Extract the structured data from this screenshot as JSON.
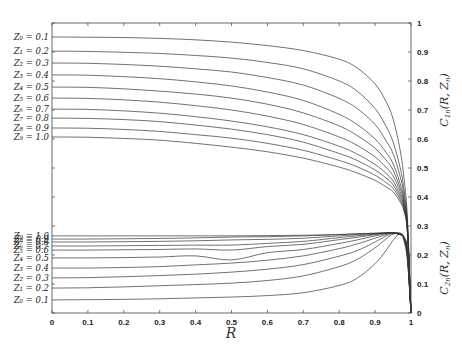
{
  "chart_data": {
    "type": "line",
    "title": "",
    "xlabel": "R",
    "ylabel_upper": "C_{1n}(R, Z_n)",
    "ylabel_lower": "C_{2n}(R, Z_n)",
    "xlim": [
      0,
      1
    ],
    "ylim": [
      0,
      1
    ],
    "grid": false,
    "x_ticks": [
      "0",
      "0.1",
      "0.2",
      "0.3",
      "0.4",
      "0.5",
      "0.6",
      "0.7",
      "0.8",
      "0.9",
      "1"
    ],
    "y_ticks": [
      "0",
      "0.1",
      "0.2",
      "0.3",
      "0.4",
      "0.5",
      "0.6",
      "0.7",
      "0.8",
      "0.9",
      "1"
    ],
    "y_axis_position": "right",
    "x": [
      0,
      0.1,
      0.2,
      0.3,
      0.4,
      0.5,
      0.6,
      0.7,
      0.8,
      0.85,
      0.9,
      0.93,
      0.95,
      0.97,
      0.98,
      0.99,
      1.0
    ],
    "series_upper": [
      {
        "name": "Z0 = 0.1",
        "label": "Z₀ = 0.1",
        "values": [
          0.952,
          0.951,
          0.95,
          0.947,
          0.942,
          0.934,
          0.922,
          0.905,
          0.875,
          0.845,
          0.79,
          0.73,
          0.67,
          0.56,
          0.47,
          0.33,
          0.0
        ]
      },
      {
        "name": "Z1 = 0.2",
        "label": "Z₁ = 0.2",
        "values": [
          0.903,
          0.902,
          0.899,
          0.895,
          0.888,
          0.879,
          0.864,
          0.842,
          0.8,
          0.765,
          0.705,
          0.645,
          0.59,
          0.5,
          0.43,
          0.31,
          0.0
        ]
      },
      {
        "name": "Z2 = 0.3",
        "label": "Z₂ = 0.3",
        "values": [
          0.862,
          0.861,
          0.857,
          0.851,
          0.842,
          0.831,
          0.812,
          0.786,
          0.74,
          0.705,
          0.65,
          0.595,
          0.55,
          0.47,
          0.41,
          0.3,
          0.0
        ]
      },
      {
        "name": "Z3 = 0.4",
        "label": "Z₃ = 0.4",
        "values": [
          0.821,
          0.82,
          0.815,
          0.808,
          0.797,
          0.783,
          0.762,
          0.733,
          0.685,
          0.65,
          0.6,
          0.555,
          0.515,
          0.445,
          0.395,
          0.295,
          0.0
        ]
      },
      {
        "name": "Z4 = 0.5",
        "label": "Z₄ = 0.5",
        "values": [
          0.779,
          0.778,
          0.773,
          0.765,
          0.755,
          0.741,
          0.72,
          0.69,
          0.645,
          0.612,
          0.568,
          0.528,
          0.493,
          0.43,
          0.385,
          0.29,
          0.0
        ]
      },
      {
        "name": "Z5 = 0.6",
        "label": "Z₅ = 0.6",
        "values": [
          0.741,
          0.74,
          0.735,
          0.727,
          0.715,
          0.7,
          0.679,
          0.65,
          0.607,
          0.578,
          0.538,
          0.503,
          0.473,
          0.418,
          0.377,
          0.287,
          0.0
        ]
      },
      {
        "name": "Z6 = 0.7",
        "label": "Z₆ = 0.7",
        "values": [
          0.703,
          0.702,
          0.697,
          0.689,
          0.677,
          0.662,
          0.642,
          0.615,
          0.575,
          0.548,
          0.512,
          0.482,
          0.455,
          0.407,
          0.37,
          0.284,
          0.0
        ]
      },
      {
        "name": "Z7 = 0.8",
        "label": "Z₇ = 0.8",
        "values": [
          0.672,
          0.671,
          0.667,
          0.66,
          0.648,
          0.634,
          0.615,
          0.589,
          0.55,
          0.526,
          0.493,
          0.466,
          0.442,
          0.398,
          0.364,
          0.282,
          0.0
        ]
      },
      {
        "name": "Z8 = 0.9",
        "label": "Z₈ = 0.9",
        "values": [
          0.638,
          0.637,
          0.633,
          0.626,
          0.615,
          0.603,
          0.585,
          0.561,
          0.526,
          0.504,
          0.475,
          0.45,
          0.43,
          0.39,
          0.358,
          0.28,
          0.0
        ]
      },
      {
        "name": "Z9 = 1.0",
        "label": "Z₉ = 1.0",
        "values": [
          0.607,
          0.606,
          0.602,
          0.596,
          0.585,
          0.572,
          0.556,
          0.534,
          0.503,
          0.483,
          0.457,
          0.435,
          0.418,
          0.382,
          0.352,
          0.278,
          0.0
        ]
      }
    ],
    "series_lower": [
      {
        "name": "Z0 = 0.1",
        "label": "Z₀ = 0.1",
        "values": [
          0.045,
          0.046,
          0.047,
          0.049,
          0.052,
          0.055,
          0.06,
          0.07,
          0.095,
          0.12,
          0.17,
          0.215,
          0.25,
          0.275,
          0.25,
          0.18,
          0.0
        ]
      },
      {
        "name": "Z1 = 0.2",
        "label": "Z₁ = 0.2",
        "values": [
          0.086,
          0.087,
          0.09,
          0.094,
          0.098,
          0.103,
          0.112,
          0.128,
          0.16,
          0.185,
          0.225,
          0.255,
          0.272,
          0.275,
          0.255,
          0.19,
          0.0
        ]
      },
      {
        "name": "Z2 = 0.3",
        "label": "Z₂ = 0.3",
        "values": [
          0.121,
          0.122,
          0.125,
          0.129,
          0.134,
          0.141,
          0.151,
          0.167,
          0.196,
          0.215,
          0.245,
          0.265,
          0.275,
          0.274,
          0.258,
          0.195,
          0.0
        ]
      },
      {
        "name": "Z3 = 0.4",
        "label": "Z₃ = 0.4",
        "values": [
          0.155,
          0.155,
          0.157,
          0.16,
          0.166,
          0.172,
          0.182,
          0.197,
          0.222,
          0.238,
          0.258,
          0.27,
          0.276,
          0.273,
          0.26,
          0.2,
          0.0
        ]
      },
      {
        "name": "Z4 = 0.5",
        "label": "Z₄ = 0.5",
        "values": [
          0.19,
          0.19,
          0.191,
          0.193,
          0.197,
          0.183,
          0.208,
          0.219,
          0.24,
          0.252,
          0.266,
          0.273,
          0.276,
          0.272,
          0.261,
          0.205,
          0.0
        ]
      },
      {
        "name": "Z5 = 0.6",
        "label": "Z₅ = 0.6",
        "values": [
          0.217,
          0.217,
          0.218,
          0.219,
          0.221,
          0.217,
          0.229,
          0.237,
          0.253,
          0.261,
          0.27,
          0.275,
          0.276,
          0.271,
          0.262,
          0.208,
          0.0
        ]
      },
      {
        "name": "Z6 = 0.7",
        "label": "Z₆ = 0.7",
        "values": [
          0.231,
          0.231,
          0.232,
          0.233,
          0.234,
          0.234,
          0.24,
          0.247,
          0.26,
          0.266,
          0.272,
          0.276,
          0.276,
          0.271,
          0.262,
          0.21,
          0.0
        ]
      },
      {
        "name": "Z7 = 0.8",
        "label": "Z₇ = 0.8",
        "values": [
          0.245,
          0.245,
          0.246,
          0.247,
          0.249,
          0.252,
          0.254,
          0.258,
          0.266,
          0.27,
          0.274,
          0.276,
          0.276,
          0.27,
          0.262,
          0.212,
          0.0
        ]
      },
      {
        "name": "Z8 = 0.9",
        "label": "Z₈ = 0.9",
        "values": [
          0.255,
          0.255,
          0.256,
          0.257,
          0.259,
          0.262,
          0.263,
          0.266,
          0.27,
          0.273,
          0.275,
          0.276,
          0.276,
          0.27,
          0.262,
          0.213,
          0.0
        ]
      },
      {
        "name": "Z9 = 1.0",
        "label": "Z₉ = 1.0",
        "values": [
          0.266,
          0.266,
          0.266,
          0.266,
          0.266,
          0.266,
          0.267,
          0.268,
          0.271,
          0.273,
          0.275,
          0.276,
          0.276,
          0.27,
          0.262,
          0.214,
          0.0
        ]
      }
    ],
    "lower_labels_visible": [
      "Z₉ = 1.0",
      "Z₆ = 0.7",
      "Z₅ = 0.6",
      "Z₄ = 0.5",
      "Z₃ = 0.4",
      "Z₂ = 0.3",
      "Z₁ = 0.2",
      "Z₀ = 0.1"
    ]
  },
  "labels": {
    "xlabel": "R",
    "ylabel_upper_main": "C",
    "ylabel_upper_sub": "1n",
    "ylabel_upper_args": "(R, Z",
    "ylabel_upper_argsub": "n",
    "ylabel_lower_main": "C",
    "ylabel_lower_sub": "2n",
    "ylabel_lower_args": "(R, Z",
    "ylabel_lower_argsub": "n"
  }
}
